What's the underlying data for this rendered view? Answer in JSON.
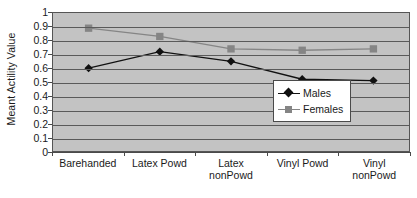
{
  "chart_data": {
    "type": "line",
    "title": "",
    "xlabel": "",
    "ylabel": "Meant Actility Value",
    "categories": [
      "Barehanded",
      "Latex Powd",
      "Latex nonPowd",
      "Vinyl Powd",
      "Vinyl nonPowd"
    ],
    "category_lines": [
      [
        "Barehanded"
      ],
      [
        "Latex Powd"
      ],
      [
        "Latex",
        "nonPowd"
      ],
      [
        "Vinyl Powd"
      ],
      [
        "Vinyl nonPowd"
      ]
    ],
    "series": [
      {
        "name": "Males",
        "marker": "diamond",
        "color": "#111111",
        "values": [
          0.6,
          0.72,
          0.65,
          0.52,
          0.51
        ]
      },
      {
        "name": "Females",
        "marker": "square",
        "color": "#858585",
        "values": [
          0.89,
          0.83,
          0.74,
          0.73,
          0.74
        ]
      }
    ],
    "ylim": [
      0,
      1
    ],
    "ytick_labels": [
      "1",
      "0.9",
      "0.8",
      "0.7",
      "0.6",
      "0.5",
      "0.4",
      "0.3",
      "0.2",
      "0.1",
      "0"
    ],
    "ytick_values": [
      1,
      0.9,
      0.8,
      0.7,
      0.6,
      0.5,
      0.4,
      0.3,
      0.2,
      0.1,
      0
    ],
    "grid": true,
    "legend_position": "lower-right-inside",
    "plot_background": "#c3c3c3",
    "gridline_color": "#5a5a5a",
    "axis_color": "#4a4a4a"
  }
}
